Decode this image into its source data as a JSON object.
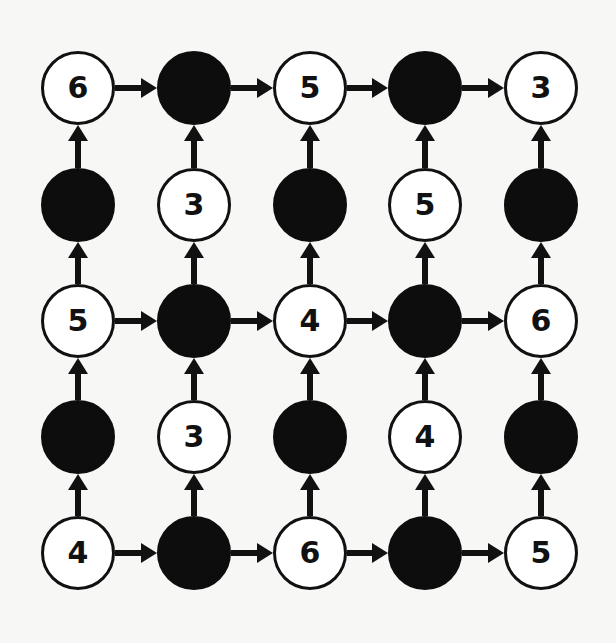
{
  "diagram": {
    "type": "directed-grid-puzzle",
    "rows": 5,
    "cols": 5,
    "colors": {
      "background": "#f7f7f5",
      "node_fill_white": "#ffffff",
      "node_fill_black": "#0d0d0d",
      "stroke": "#111111"
    },
    "grid": [
      [
        {
          "color": "white",
          "value": "6"
        },
        {
          "color": "black",
          "value": ""
        },
        {
          "color": "white",
          "value": "5"
        },
        {
          "color": "black",
          "value": ""
        },
        {
          "color": "white",
          "value": "3"
        }
      ],
      [
        {
          "color": "black",
          "value": ""
        },
        {
          "color": "white",
          "value": "3"
        },
        {
          "color": "black",
          "value": ""
        },
        {
          "color": "white",
          "value": "5"
        },
        {
          "color": "black",
          "value": ""
        }
      ],
      [
        {
          "color": "white",
          "value": "5"
        },
        {
          "color": "black",
          "value": ""
        },
        {
          "color": "white",
          "value": "4"
        },
        {
          "color": "black",
          "value": ""
        },
        {
          "color": "white",
          "value": "6"
        }
      ],
      [
        {
          "color": "black",
          "value": ""
        },
        {
          "color": "white",
          "value": "3"
        },
        {
          "color": "black",
          "value": ""
        },
        {
          "color": "white",
          "value": "4"
        },
        {
          "color": "black",
          "value": ""
        }
      ],
      [
        {
          "color": "white",
          "value": "4"
        },
        {
          "color": "black",
          "value": ""
        },
        {
          "color": "white",
          "value": "6"
        },
        {
          "color": "black",
          "value": ""
        },
        {
          "color": "white",
          "value": "5"
        }
      ]
    ],
    "arrows": {
      "horizontal_rows": [
        0,
        2,
        4
      ],
      "horizontal_direction": "right",
      "vertical_direction": "up",
      "vertical_cols": [
        0,
        1,
        2,
        3,
        4
      ]
    }
  }
}
